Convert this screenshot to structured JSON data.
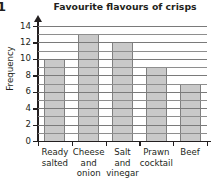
{
  "question_number": "1",
  "chart_data": {
    "type": "bar",
    "title": "Favourite flavours of crisps",
    "xlabel": "",
    "ylabel": "Frequency",
    "categories": [
      "Ready salted",
      "Cheese and onion",
      "Salt and vinegar",
      "Prawn cocktail",
      "Beef"
    ],
    "category_lines": [
      [
        "Ready",
        "salted"
      ],
      [
        "Cheese",
        "and",
        "onion"
      ],
      [
        "Salt",
        "and",
        "vinegar"
      ],
      [
        "Prawn",
        "cocktail"
      ],
      [
        "Beef"
      ]
    ],
    "values": [
      10,
      13,
      12,
      9,
      7
    ],
    "ylim": [
      0,
      14
    ],
    "ytick_labels": [
      "0",
      "2",
      "4",
      "6",
      "8",
      "10",
      "12",
      "14"
    ],
    "ytick_values": [
      0,
      2,
      4,
      6,
      8,
      10,
      12,
      14
    ],
    "minor_grid_step": 1,
    "grid": true,
    "legend": "none",
    "bar_color": "#c9c9c9",
    "bar_border_color": "#808080",
    "axis_color": "#231f20",
    "grid_color": "#8e8e8e"
  }
}
